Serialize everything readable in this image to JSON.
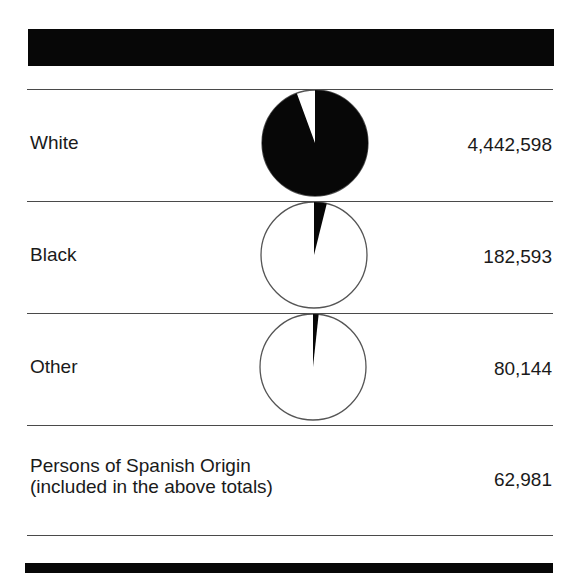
{
  "chart_data": {
    "type": "pie",
    "title": "",
    "categories": [
      "White",
      "Black",
      "Other"
    ],
    "values": [
      4442598,
      182593,
      80144
    ],
    "total": 4705335,
    "shares_percent": [
      94.4,
      3.9,
      1.7
    ],
    "note_row": {
      "label": "Persons of Spanish Origin (included in the above totals)",
      "value": 62981
    },
    "legend": "none",
    "colors": {
      "fill": "#070707",
      "background": "#ffffff"
    }
  },
  "rows": [
    {
      "label": "White",
      "value": "4,442,598"
    },
    {
      "label": "Black",
      "value": "182,593"
    },
    {
      "label": "Other",
      "value": "80,144"
    }
  ],
  "spanish": {
    "label_line1": "Persons of Spanish Origin",
    "label_line2": "(included in the above totals)",
    "value": "62,981"
  }
}
